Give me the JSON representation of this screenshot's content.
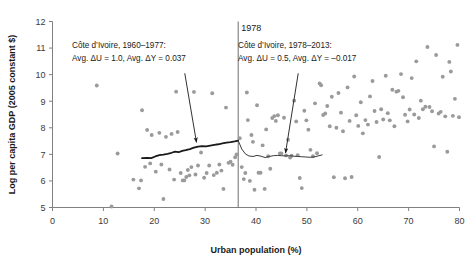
{
  "chart_data": {
    "type": "scatter",
    "title": "",
    "xlabel": "Urban population (%)",
    "ylabel": "Log per capita GDP (2005 constant $)",
    "xlim": [
      0,
      80
    ],
    "ylim": [
      5,
      12
    ],
    "xticks": [
      0,
      10,
      20,
      30,
      40,
      50,
      60,
      70,
      80
    ],
    "yticks": [
      5,
      6,
      7,
      8,
      9,
      10,
      11,
      12
    ],
    "grid": false,
    "legend_position": "none",
    "point_color": "#9a9a9a",
    "axis_color": "#808080",
    "text_color": "#1a1a1a",
    "divider": {
      "label": "1978",
      "x_value": 36.5,
      "color": "#6e6e6e"
    },
    "annotations": [
      {
        "name": "left-annotation",
        "line1": "Côte d’Ivoire, 1960–1977:",
        "line2": "Avg. ΔU = 1.0, Avg. ΔY = 0.037",
        "arrow_from": [
          26.0,
          10.05
        ],
        "arrow_to": [
          28.3,
          7.45
        ]
      },
      {
        "name": "right-annotation",
        "line1": "Côte d’Ivoire, 1978–2013:",
        "line2": "Avg. ΔU = 0.5, Avg. ΔY = –0.017",
        "arrow_from": [
          48.3,
          10.05
        ],
        "arrow_to": [
          45.8,
          7.05
        ]
      }
    ],
    "series": [
      {
        "name": "trend-1960-1977",
        "type": "line",
        "color": "#1a1a1a",
        "width": 1.8,
        "points": [
          [
            17.6,
            6.86
          ],
          [
            18.6,
            6.87
          ],
          [
            19.4,
            6.86
          ],
          [
            20.2,
            6.92
          ],
          [
            21.0,
            6.97
          ],
          [
            21.8,
            6.99
          ],
          [
            22.6,
            7.02
          ],
          [
            23.4,
            7.06
          ],
          [
            24.1,
            7.1
          ],
          [
            24.8,
            7.08
          ],
          [
            25.5,
            7.13
          ],
          [
            26.2,
            7.16
          ],
          [
            27.0,
            7.2
          ],
          [
            27.8,
            7.25
          ],
          [
            28.6,
            7.29
          ],
          [
            29.4,
            7.31
          ],
          [
            30.2,
            7.3
          ],
          [
            31.0,
            7.33
          ],
          [
            31.8,
            7.36
          ],
          [
            32.6,
            7.38
          ],
          [
            33.4,
            7.41
          ],
          [
            34.2,
            7.44
          ],
          [
            35.0,
            7.46
          ],
          [
            35.8,
            7.49
          ],
          [
            36.5,
            7.52
          ]
        ]
      },
      {
        "name": "trend-1978-2013",
        "type": "line",
        "color": "#3a3a3a",
        "width": 1.0,
        "points": [
          [
            36.5,
            7.52
          ],
          [
            37.2,
            7.2
          ],
          [
            37.9,
            7.02
          ],
          [
            38.6,
            6.94
          ],
          [
            39.4,
            6.92
          ],
          [
            40.2,
            6.96
          ],
          [
            41.0,
            6.93
          ],
          [
            41.8,
            6.88
          ],
          [
            42.6,
            6.92
          ],
          [
            43.4,
            6.95
          ],
          [
            44.2,
            6.96
          ],
          [
            45.0,
            6.95
          ],
          [
            45.8,
            6.94
          ],
          [
            46.6,
            6.95
          ],
          [
            47.4,
            6.93
          ],
          [
            48.2,
            6.92
          ],
          [
            49.0,
            6.91
          ],
          [
            49.8,
            6.9
          ],
          [
            50.6,
            6.89
          ],
          [
            51.4,
            6.9
          ],
          [
            52.2,
            6.94
          ],
          [
            53.0,
            6.98
          ]
        ]
      },
      {
        "name": "scatter-observations",
        "type": "scatter",
        "color": "#9a9a9a",
        "marker_size": 3.0,
        "points": [
          [
            8.7,
            9.59
          ],
          [
            11.6,
            5.04
          ],
          [
            12.8,
            7.03
          ],
          [
            15.9,
            6.05
          ],
          [
            17.0,
            5.72
          ],
          [
            17.4,
            6.02
          ],
          [
            17.6,
            8.66
          ],
          [
            18.2,
            6.53
          ],
          [
            18.6,
            7.92
          ],
          [
            19.2,
            6.66
          ],
          [
            19.5,
            7.73
          ],
          [
            20.3,
            6.35
          ],
          [
            21.0,
            7.81
          ],
          [
            21.4,
            6.62
          ],
          [
            21.8,
            5.32
          ],
          [
            22.3,
            7.66
          ],
          [
            23.0,
            6.43
          ],
          [
            23.4,
            7.77
          ],
          [
            23.9,
            6.05
          ],
          [
            24.3,
            9.36
          ],
          [
            24.6,
            7.84
          ],
          [
            25.2,
            6.3
          ],
          [
            25.6,
            6.02
          ],
          [
            25.9,
            6.02
          ],
          [
            26.3,
            6.15
          ],
          [
            26.6,
            6.41
          ],
          [
            26.9,
            6.21
          ],
          [
            27.3,
            6.52
          ],
          [
            27.8,
            9.35
          ],
          [
            28.1,
            6.24
          ],
          [
            28.6,
            6.58
          ],
          [
            29.2,
            7.07
          ],
          [
            29.8,
            6.12
          ],
          [
            30.3,
            6.3
          ],
          [
            30.8,
            6.58
          ],
          [
            31.4,
            9.3
          ],
          [
            31.7,
            6.22
          ],
          [
            32.3,
            6.31
          ],
          [
            32.8,
            6.62
          ],
          [
            33.2,
            6.39
          ],
          [
            33.6,
            5.7
          ],
          [
            34.1,
            8.76
          ],
          [
            34.6,
            6.68
          ],
          [
            35.0,
            6.72
          ],
          [
            35.4,
            6.61
          ],
          [
            35.9,
            6.89
          ],
          [
            36.2,
            7.0
          ],
          [
            36.8,
            7.61
          ],
          [
            37.2,
            6.52
          ],
          [
            37.6,
            6.07
          ],
          [
            37.9,
            6.3
          ],
          [
            38.2,
            9.33
          ],
          [
            38.4,
            8.29
          ],
          [
            38.8,
            6.0
          ],
          [
            39.1,
            7.73
          ],
          [
            39.4,
            7.47
          ],
          [
            39.7,
            5.67
          ],
          [
            40.2,
            8.85
          ],
          [
            40.5,
            6.31
          ],
          [
            40.9,
            6.31
          ],
          [
            41.3,
            7.34
          ],
          [
            41.7,
            5.7
          ],
          [
            42.0,
            7.94
          ],
          [
            42.4,
            6.93
          ],
          [
            42.8,
            6.46
          ],
          [
            43.2,
            8.37
          ],
          [
            43.6,
            8.44
          ],
          [
            43.9,
            8.26
          ],
          [
            44.3,
            8.47
          ],
          [
            44.7,
            7.03
          ],
          [
            45.0,
            7.03
          ],
          [
            45.5,
            8.38
          ],
          [
            45.9,
            6.96
          ],
          [
            46.3,
            7.55
          ],
          [
            46.7,
            6.88
          ],
          [
            47.0,
            6.95
          ],
          [
            47.5,
            9.02
          ],
          [
            47.9,
            8.24
          ],
          [
            48.2,
            6.97
          ],
          [
            48.6,
            6.11
          ],
          [
            49.0,
            5.73
          ],
          [
            49.5,
            8.64
          ],
          [
            49.9,
            8.28
          ],
          [
            50.3,
            7.93
          ],
          [
            50.7,
            7.17
          ],
          [
            51.2,
            6.93
          ],
          [
            51.6,
            8.92
          ],
          [
            52.0,
            7.04
          ],
          [
            52.5,
            9.67
          ],
          [
            52.8,
            9.6
          ],
          [
            53.2,
            8.48
          ],
          [
            53.6,
            8.54
          ],
          [
            54.0,
            8.82
          ],
          [
            54.5,
            8.06
          ],
          [
            54.9,
            9.17
          ],
          [
            55.3,
            6.14
          ],
          [
            55.8,
            8.0
          ],
          [
            56.2,
            9.31
          ],
          [
            56.7,
            8.57
          ],
          [
            57.1,
            7.87
          ],
          [
            57.5,
            6.1
          ],
          [
            58.0,
            9.52
          ],
          [
            58.4,
            8.26
          ],
          [
            58.8,
            6.15
          ],
          [
            59.3,
            9.93
          ],
          [
            59.7,
            8.47
          ],
          [
            60.1,
            8.07
          ],
          [
            60.6,
            8.96
          ],
          [
            61.0,
            7.79
          ],
          [
            61.5,
            8.29
          ],
          [
            62.0,
            8.12
          ],
          [
            62.4,
            9.18
          ],
          [
            62.9,
            9.76
          ],
          [
            63.3,
            8.63
          ],
          [
            63.7,
            8.22
          ],
          [
            64.2,
            6.9
          ],
          [
            64.6,
            8.7
          ],
          [
            65.0,
            8.31
          ],
          [
            65.5,
            9.96
          ],
          [
            65.9,
            8.55
          ],
          [
            66.3,
            8.28
          ],
          [
            66.8,
            9.43
          ],
          [
            67.2,
            8.06
          ],
          [
            67.6,
            9.36
          ],
          [
            68.0,
            9.39
          ],
          [
            68.5,
            10.02
          ],
          [
            68.9,
            9.15
          ],
          [
            69.3,
            8.49
          ],
          [
            69.8,
            8.24
          ],
          [
            70.2,
            8.69
          ],
          [
            70.6,
            9.87
          ],
          [
            71.1,
            8.5
          ],
          [
            71.5,
            10.5
          ],
          [
            72.0,
            8.37
          ],
          [
            72.4,
            9.02
          ],
          [
            72.8,
            8.7
          ],
          [
            73.3,
            8.79
          ],
          [
            73.7,
            11.04
          ],
          [
            74.1,
            8.78
          ],
          [
            74.6,
            8.62
          ],
          [
            75.0,
            7.3
          ],
          [
            75.4,
            10.74
          ],
          [
            75.9,
            8.54
          ],
          [
            76.3,
            8.6
          ],
          [
            76.7,
            9.92
          ],
          [
            77.2,
            8.43
          ],
          [
            77.6,
            7.1
          ],
          [
            78.0,
            10.48
          ],
          [
            78.3,
            10.12
          ],
          [
            78.7,
            8.45
          ],
          [
            79.1,
            9.09
          ],
          [
            79.6,
            11.12
          ],
          [
            79.9,
            8.4
          ]
        ]
      }
    ]
  }
}
